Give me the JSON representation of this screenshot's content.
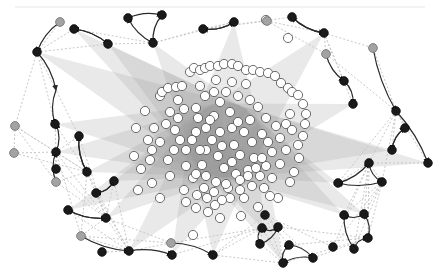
{
  "diagram": {
    "type": "network-graph",
    "width": 440,
    "height": 275,
    "colors": {
      "background": "#ffffff",
      "hub_node": "#1a1a1a",
      "peripheral_node": "#a3a3a3",
      "core_node": "#ffffff",
      "fan_edges": "#9a9a9a",
      "dashed_edges": "#c8c8c8",
      "directed_edges": "#2a2a2a"
    },
    "black_nodes": [
      [
        37,
        52
      ],
      [
        128,
        18
      ],
      [
        162,
        15
      ],
      [
        153,
        43
      ],
      [
        108,
        44
      ],
      [
        74,
        29
      ],
      [
        203,
        29
      ],
      [
        234,
        22
      ],
      [
        292,
        17
      ],
      [
        324,
        33
      ],
      [
        344,
        81
      ],
      [
        353,
        104
      ],
      [
        396,
        111
      ],
      [
        405,
        128
      ],
      [
        392,
        150
      ],
      [
        369,
        163
      ],
      [
        428,
        163
      ],
      [
        338,
        183
      ],
      [
        382,
        182
      ],
      [
        364,
        214
      ],
      [
        344,
        215
      ],
      [
        265,
        215
      ],
      [
        333,
        247
      ],
      [
        354,
        249
      ],
      [
        368,
        238
      ],
      [
        289,
        245
      ],
      [
        313,
        258
      ],
      [
        283,
        263
      ],
      [
        260,
        244
      ],
      [
        278,
        227
      ],
      [
        262,
        228
      ],
      [
        213,
        255
      ],
      [
        172,
        255
      ],
      [
        129,
        251
      ],
      [
        102,
        252
      ],
      [
        68,
        210
      ],
      [
        106,
        218
      ],
      [
        96,
        193
      ],
      [
        114,
        181
      ],
      [
        56,
        152
      ],
      [
        56,
        169
      ],
      [
        79,
        136
      ],
      [
        87,
        172
      ],
      [
        55,
        124
      ]
    ],
    "gray_nodes": [
      [
        60,
        22
      ],
      [
        267,
        21
      ],
      [
        326,
        54
      ],
      [
        373,
        48
      ],
      [
        15,
        126
      ],
      [
        14,
        153
      ],
      [
        56,
        182
      ],
      [
        81,
        236
      ],
      [
        171,
        243
      ]
    ],
    "white_nodes": [
      [
        266,
        20
      ],
      [
        288,
        38
      ],
      [
        193,
        235
      ],
      [
        220,
        218
      ],
      [
        241,
        216
      ],
      [
        184,
        190
      ],
      [
        186,
        202
      ],
      [
        160,
        198
      ],
      [
        170,
        176
      ],
      [
        138,
        190
      ],
      [
        152,
        183
      ],
      [
        141,
        169
      ],
      [
        134,
        156
      ],
      [
        152,
        150
      ],
      [
        160,
        142
      ],
      [
        154,
        128
      ],
      [
        136,
        128
      ],
      [
        145,
        111
      ],
      [
        160,
        96
      ],
      [
        162,
        92
      ],
      [
        168,
        88
      ],
      [
        176,
        87
      ],
      [
        182,
        86
      ],
      [
        190,
        72
      ],
      [
        194,
        68
      ],
      [
        200,
        70
      ],
      [
        205,
        68
      ],
      [
        210,
        66
      ],
      [
        218,
        66
      ],
      [
        224,
        64
      ],
      [
        232,
        64
      ],
      [
        238,
        66
      ],
      [
        246,
        70
      ],
      [
        253,
        70
      ],
      [
        260,
        72
      ],
      [
        268,
        73
      ],
      [
        275,
        76
      ],
      [
        281,
        83
      ],
      [
        288,
        88
      ],
      [
        292,
        92
      ],
      [
        298,
        95
      ],
      [
        303,
        104
      ],
      [
        306,
        114
      ],
      [
        305,
        124
      ],
      [
        303,
        136
      ],
      [
        298,
        145
      ],
      [
        299,
        158
      ],
      [
        294,
        172
      ],
      [
        290,
        182
      ],
      [
        278,
        198
      ],
      [
        270,
        196
      ],
      [
        258,
        207
      ],
      [
        244,
        198
      ],
      [
        230,
        198
      ],
      [
        215,
        205
      ],
      [
        207,
        198
      ],
      [
        197,
        195
      ],
      [
        193,
        178
      ],
      [
        186,
        166
      ],
      [
        186,
        150
      ],
      [
        180,
        140
      ],
      [
        175,
        130
      ],
      [
        178,
        118
      ],
      [
        184,
        109
      ],
      [
        196,
        108
      ],
      [
        205,
        96
      ],
      [
        214,
        92
      ],
      [
        226,
        92
      ],
      [
        238,
        96
      ],
      [
        250,
        100
      ],
      [
        258,
        107
      ],
      [
        266,
        118
      ],
      [
        276,
        126
      ],
      [
        280,
        138
      ],
      [
        272,
        152
      ],
      [
        266,
        166
      ],
      [
        260,
        176
      ],
      [
        252,
        186
      ],
      [
        240,
        190
      ],
      [
        228,
        188
      ],
      [
        216,
        182
      ],
      [
        206,
        176
      ],
      [
        202,
        165
      ],
      [
        206,
        150
      ],
      [
        212,
        140
      ],
      [
        220,
        132
      ],
      [
        232,
        128
      ],
      [
        244,
        132
      ],
      [
        252,
        142
      ],
      [
        254,
        158
      ],
      [
        248,
        170
      ],
      [
        236,
        174
      ],
      [
        224,
        168
      ],
      [
        218,
        156
      ],
      [
        222,
        146
      ],
      [
        234,
        145
      ],
      [
        240,
        155
      ],
      [
        232,
        162
      ],
      [
        226,
        184
      ],
      [
        240,
        180
      ],
      [
        248,
        176
      ],
      [
        256,
        168
      ],
      [
        262,
        158
      ],
      [
        268,
        142
      ],
      [
        262,
        134
      ],
      [
        230,
        112
      ],
      [
        214,
        116
      ],
      [
        206,
        128
      ],
      [
        196,
        132
      ],
      [
        178,
        100
      ],
      [
        170,
        112
      ],
      [
        166,
        124
      ],
      [
        168,
        160
      ],
      [
        174,
        150
      ],
      [
        192,
        140
      ],
      [
        198,
        118
      ],
      [
        220,
        102
      ],
      [
        246,
        84
      ],
      [
        232,
        82
      ],
      [
        216,
        80
      ],
      [
        200,
        86
      ],
      [
        290,
        114
      ],
      [
        286,
        124
      ],
      [
        292,
        130
      ],
      [
        286,
        150
      ],
      [
        280,
        164
      ],
      [
        272,
        178
      ],
      [
        200,
        150
      ],
      [
        210,
        120
      ],
      [
        238,
        122
      ],
      [
        250,
        120
      ],
      [
        204,
        188
      ],
      [
        214,
        192
      ],
      [
        196,
        174
      ],
      [
        222,
        200
      ],
      [
        264,
        188
      ],
      [
        196,
        208
      ],
      [
        208,
        212
      ],
      [
        150,
        160
      ],
      [
        148,
        140
      ]
    ],
    "directed_edges": [
      [
        [
          60,
          22
        ],
        [
          37,
          52
        ]
      ],
      [
        [
          37,
          52
        ],
        [
          56,
          90
        ]
      ],
      [
        [
          56,
          90
        ],
        [
          55,
          124
        ]
      ],
      [
        [
          128,
          18
        ],
        [
          162,
          15
        ]
      ],
      [
        [
          162,
          15
        ],
        [
          153,
          43
        ]
      ],
      [
        [
          153,
          43
        ],
        [
          128,
          18
        ]
      ],
      [
        [
          108,
          44
        ],
        [
          74,
          29
        ]
      ],
      [
        [
          74,
          29
        ],
        [
          108,
          44
        ]
      ],
      [
        [
          203,
          29
        ],
        [
          234,
          22
        ]
      ],
      [
        [
          234,
          22
        ],
        [
          203,
          29
        ]
      ],
      [
        [
          292,
          17
        ],
        [
          324,
          33
        ]
      ],
      [
        [
          324,
          33
        ],
        [
          292,
          17
        ]
      ],
      [
        [
          326,
          54
        ],
        [
          344,
          81
        ]
      ],
      [
        [
          344,
          81
        ],
        [
          353,
          104
        ]
      ],
      [
        [
          373,
          48
        ],
        [
          396,
          111
        ]
      ],
      [
        [
          396,
          111
        ],
        [
          428,
          163
        ]
      ],
      [
        [
          405,
          128
        ],
        [
          392,
          150
        ]
      ],
      [
        [
          392,
          150
        ],
        [
          405,
          128
        ]
      ],
      [
        [
          369,
          163
        ],
        [
          382,
          182
        ]
      ],
      [
        [
          382,
          182
        ],
        [
          338,
          183
        ]
      ],
      [
        [
          338,
          183
        ],
        [
          369,
          163
        ]
      ],
      [
        [
          364,
          214
        ],
        [
          344,
          215
        ]
      ],
      [
        [
          344,
          215
        ],
        [
          354,
          249
        ]
      ],
      [
        [
          354,
          249
        ],
        [
          368,
          238
        ]
      ],
      [
        [
          368,
          238
        ],
        [
          364,
          214
        ]
      ],
      [
        [
          289,
          245
        ],
        [
          313,
          258
        ]
      ],
      [
        [
          313,
          258
        ],
        [
          283,
          263
        ]
      ],
      [
        [
          283,
          263
        ],
        [
          289,
          245
        ]
      ],
      [
        [
          260,
          244
        ],
        [
          278,
          227
        ]
      ],
      [
        [
          278,
          227
        ],
        [
          262,
          228
        ]
      ],
      [
        [
          262,
          228
        ],
        [
          260,
          244
        ]
      ],
      [
        [
          171,
          243
        ],
        [
          213,
          255
        ]
      ],
      [
        [
          81,
          236
        ],
        [
          129,
          251
        ]
      ],
      [
        [
          129,
          251
        ],
        [
          172,
          255
        ]
      ],
      [
        [
          68,
          210
        ],
        [
          106,
          218
        ]
      ],
      [
        [
          106,
          218
        ],
        [
          68,
          210
        ]
      ],
      [
        [
          96,
          193
        ],
        [
          114,
          181
        ]
      ],
      [
        [
          114,
          181
        ],
        [
          96,
          193
        ]
      ],
      [
        [
          56,
          152
        ],
        [
          56,
          124
        ]
      ],
      [
        [
          56,
          182
        ],
        [
          56,
          152
        ]
      ],
      [
        [
          79,
          136
        ],
        [
          87,
          172
        ]
      ],
      [
        [
          87,
          172
        ],
        [
          79,
          136
        ]
      ]
    ],
    "fan_hubs": [
      [
        37,
        52
      ],
      [
        55,
        124
      ],
      [
        56,
        152
      ],
      [
        87,
        172
      ],
      [
        106,
        218
      ],
      [
        129,
        251
      ],
      [
        172,
        255
      ],
      [
        213,
        255
      ],
      [
        262,
        228
      ],
      [
        283,
        263
      ],
      [
        344,
        215
      ],
      [
        364,
        214
      ],
      [
        338,
        183
      ],
      [
        428,
        163
      ],
      [
        392,
        150
      ],
      [
        353,
        104
      ],
      [
        324,
        33
      ],
      [
        234,
        22
      ],
      [
        153,
        43
      ],
      [
        108,
        44
      ],
      [
        74,
        29
      ],
      [
        114,
        181
      ],
      [
        68,
        210
      ]
    ]
  }
}
